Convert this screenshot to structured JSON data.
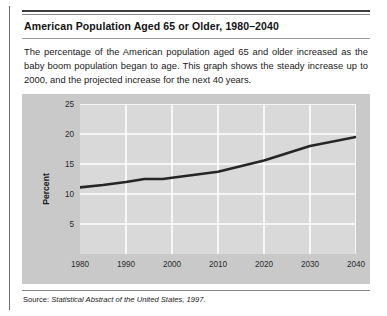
{
  "figure": {
    "title": "American Population Aged 65 or Older, 1980–2040",
    "blurb": "The percentage of the American population aged 65 and older increased as the baby boom population began to age. This graph shows the steady increase up to 2000, and the projected increase for the next 40 years.",
    "source_prefix": "Source: ",
    "source_italic": "Statistical Abstract of the United States, 1997",
    "source_suffix": "."
  },
  "colors": {
    "band": "#c9c9c9",
    "plot": "#d9d9d9",
    "gridline": "#ffffff",
    "line": "#262626",
    "rule": "#3d3d3d"
  },
  "chart_data": {
    "type": "line",
    "title": "",
    "xlabel": "",
    "ylabel": "Percent",
    "xlim": [
      1980,
      2040
    ],
    "ylim": [
      0,
      25
    ],
    "grid": true,
    "legend": "none",
    "xticks": [
      1980,
      1990,
      2000,
      2010,
      2020,
      2030,
      2040
    ],
    "yticks": [
      5,
      10,
      15,
      20,
      25
    ],
    "series": [
      {
        "name": "Percent aged 65 or older",
        "x": [
          1980,
          1985,
          1990,
          1994,
          1998,
          2000,
          2010,
          2020,
          2030,
          2040
        ],
        "values": [
          11.1,
          11.5,
          12.0,
          12.5,
          12.5,
          12.7,
          13.7,
          15.6,
          18.0,
          19.5
        ]
      }
    ]
  }
}
